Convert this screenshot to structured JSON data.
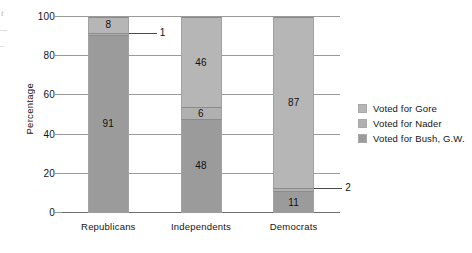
{
  "page_bleed": {
    "fragment_1": "t",
    "fragment_2": "—",
    "fragment_3": "–"
  },
  "colors": {
    "gore": "#b6b6b6",
    "nader": "#b0b0b0",
    "bush": "#9b9b9b",
    "gridline": "#9a9a9a",
    "axis": "#6d6d6d",
    "text": "#141414"
  },
  "chart_data": {
    "type": "bar",
    "subtype": "stacked-vertical",
    "title": "",
    "xlabel": "",
    "ylabel": "Percentage",
    "ylim": [
      0,
      100
    ],
    "yticks": [
      0,
      20,
      40,
      60,
      80,
      100
    ],
    "ytick_labels": [
      "0",
      "20",
      "40",
      "60",
      "80",
      "100"
    ],
    "grid": true,
    "grid_axis": "y",
    "legend_position": "right",
    "categories": [
      "Republicans",
      "Independents",
      "Democrats"
    ],
    "series": [
      {
        "name": "Voted for Gore",
        "color": "#b6b6b6",
        "values": [
          8,
          46,
          87
        ],
        "labels": [
          "8",
          "46",
          "87"
        ]
      },
      {
        "name": "Voted for Nader",
        "color": "#b0b0b0",
        "values": [
          1,
          6,
          2
        ],
        "labels": [
          "1",
          "6",
          "2"
        ],
        "label_callout": [
          true,
          false,
          true
        ]
      },
      {
        "name": "Voted for Bush, G.W.",
        "color": "#9b9b9b",
        "values": [
          91,
          48,
          11
        ],
        "labels": [
          "91",
          "48",
          "11"
        ]
      }
    ]
  },
  "legend": {
    "items": [
      {
        "label": "Voted for Gore",
        "color": "#b6b6b6"
      },
      {
        "label": "Voted for Nader",
        "color": "#b0b0b0"
      },
      {
        "label": "Voted for Bush, G.W.",
        "color": "#9b9b9b"
      }
    ]
  }
}
